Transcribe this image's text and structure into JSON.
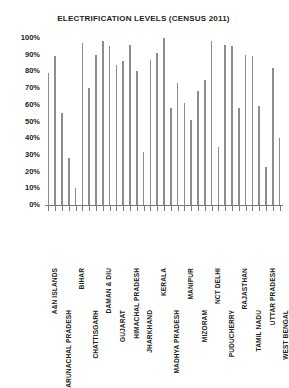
{
  "chart": {
    "title": "ELECTRIFICATION LEVELS (CENSUS 2011)",
    "accent_color": "#8d8d8d",
    "text_color": "#231f20",
    "axis_color": "#7a7a7a"
  },
  "y_axis": {
    "ticks": [
      "100%",
      "90%",
      "80%",
      "70%",
      "60%",
      "50%",
      "40%",
      "30%",
      "20%",
      "10%",
      "0%"
    ]
  },
  "chart_data": {
    "type": "bar",
    "title": "ELECTRIFICATION LEVELS (CENSUS 2011)",
    "xlabel": "",
    "ylabel": "",
    "ylim": [
      0,
      100
    ],
    "ytick_labels": [
      "0%",
      "10%",
      "20%",
      "30%",
      "40%",
      "50%",
      "60%",
      "70%",
      "80%",
      "90%",
      "100%"
    ],
    "grid": false,
    "legend": "none",
    "label_rotation": -90,
    "labels_staggered": true,
    "categories": [
      "A&N ISLANDS",
      "ANDHRA PRADESH",
      "ARUNACHAL PRADESH",
      "ASSAM",
      "BIHAR",
      "CHANDIGARH",
      "CHATTISGARH",
      "DADRA & NAGAR HAVELI",
      "DAMAN & DIU",
      "GOA",
      "GUJARAT",
      "HARYANA",
      "HIMACHAL PRADESH",
      "JAMMU & KASHMIR",
      "JHARKHAND",
      "KARNATAKA",
      "KERALA",
      "LAKSHADWEEP",
      "MADHYA PRADESH",
      "MAHARASHTRA",
      "MANIPUR",
      "MEGHALAYA",
      "MIZORAM",
      "NAGALAND",
      "NCT DELHI",
      "ORISSA",
      "PUDUCHERRY",
      "PUNJAB",
      "RAJASTHAN",
      "SIKKIM",
      "TAMIL NADU",
      "TRIPURA",
      "UTTAR PRADESH",
      "UTTARAKHAND",
      "WEST BENGAL"
    ],
    "visible_tick_labels": [
      "A&N ISLANDS",
      "ARUNACHAL PRADESH",
      "BIHAR",
      "CHATTISGARH",
      "DAMAN & DIU",
      "GUJARAT",
      "HIMACHAL PRADESH",
      "JHARKHAND",
      "KERALA",
      "MADHYA PRADESH",
      "MANIPUR",
      "MIZORAM",
      "NCT DELHI",
      "PUDUCHERRY",
      "RAJASTHAN",
      "TAMIL NADU",
      "UTTAR PRADESH",
      "WEST BENGAL"
    ],
    "values": [
      79,
      89,
      55,
      28,
      10,
      97,
      70,
      90,
      98,
      95,
      84,
      86,
      96,
      80,
      32,
      87,
      91,
      100,
      58,
      73,
      61,
      51,
      68,
      75,
      98,
      35,
      96,
      95,
      58,
      90,
      89,
      59,
      23,
      82,
      40
    ]
  }
}
